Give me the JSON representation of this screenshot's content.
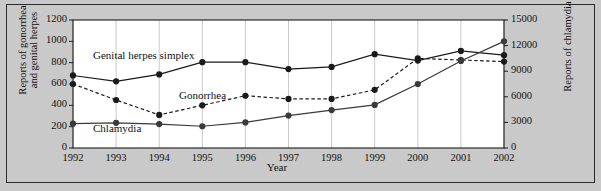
{
  "figure": {
    "background_color": "#c9c9c9",
    "plot_background_color": "#ffffff",
    "border_color": "#2b2b2b"
  },
  "axes": {
    "x_label": "Year",
    "y_left_label_line1": "Reports of gonorrhea",
    "y_left_label_line2": "and genital herpes",
    "y_right_label": "Reports of chlamydia",
    "y_left_ticks": [
      "0",
      "200",
      "400",
      "600",
      "800",
      "1000",
      "1200"
    ],
    "y_right_ticks": [
      "0",
      "3000",
      "6000",
      "9000",
      "12000",
      "15000"
    ],
    "x_ticks": [
      "1992",
      "1993",
      "1994",
      "1995",
      "1996",
      "1997",
      "1998",
      "1999",
      "2000",
      "2001",
      "2002"
    ]
  },
  "series_labels": {
    "herpes": "Genital herpes simplex",
    "gonorrhea": "Gonorrhea",
    "chlamydia": "Chlamydia"
  },
  "chart_data": {
    "type": "line",
    "title": "",
    "xlabel": "Year",
    "ylabel": "Reports of gonorrhea and genital herpes",
    "y2label": "Reports of chlamydia",
    "x": [
      1992,
      1993,
      1994,
      1995,
      1996,
      1997,
      1998,
      1999,
      2000,
      2001,
      2002
    ],
    "ylim": [
      0,
      1200
    ],
    "y2lim": [
      0,
      15000
    ],
    "yticks": [
      0,
      200,
      400,
      600,
      800,
      1000,
      1200
    ],
    "y2ticks": [
      0,
      3000,
      6000,
      9000,
      12000,
      15000
    ],
    "grid": "vertical",
    "legend": "inline-labels",
    "series": [
      {
        "name": "Genital herpes simplex",
        "axis": "left",
        "line_style": "solid",
        "marker": "circle",
        "color": "#1a1a1a",
        "values": [
          680,
          625,
          690,
          805,
          805,
          740,
          760,
          880,
          820,
          910,
          870
        ]
      },
      {
        "name": "Gonorrhea",
        "axis": "left",
        "line_style": "dashed",
        "marker": "circle",
        "color": "#1a1a1a",
        "values": [
          600,
          450,
          310,
          400,
          490,
          460,
          460,
          545,
          840,
          825,
          810
        ]
      },
      {
        "name": "Chlamydia",
        "axis": "right",
        "line_style": "solid",
        "marker": "circle",
        "color": "#3a3a3a",
        "values": [
          2850,
          2950,
          2800,
          2550,
          3000,
          3800,
          4450,
          5050,
          7500,
          10200,
          12500
        ]
      }
    ]
  }
}
